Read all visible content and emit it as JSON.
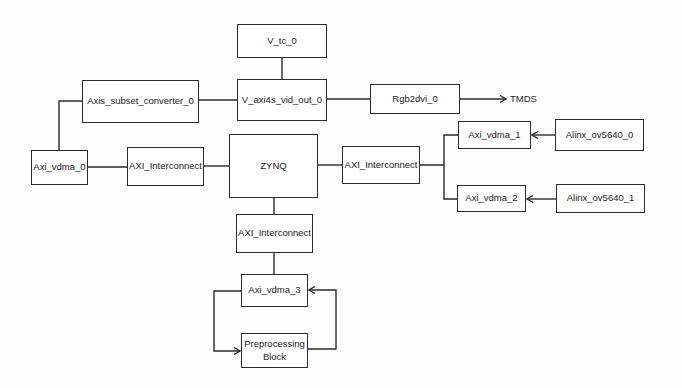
{
  "diagram": {
    "colors": {
      "stroke": "#2b2b2b",
      "text": "#222222",
      "background": "#ffffff"
    },
    "blocks": {
      "v_tc_0": {
        "label": "V_tc_0"
      },
      "v_axi4s_vid_out_0": {
        "label": "V_axi4s_vid_out_0"
      },
      "axis_subset_converter_0": {
        "label": "Axis_subset_converter_0"
      },
      "rgb2dvi_0": {
        "label": "Rgb2dvi_0"
      },
      "axi_vdma_0": {
        "label": "Axi_vdma_0"
      },
      "axi_interconnect_left": {
        "label": "AXI_Interconnect"
      },
      "zynq": {
        "label": "ZYNQ"
      },
      "axi_interconnect_right": {
        "label": "AXI_Interconnect"
      },
      "axi_vdma_1": {
        "label": "Axi_vdma_1"
      },
      "axi_vdma_2": {
        "label": "Axi_vdma_2"
      },
      "alinx_ov5640_0": {
        "label": "Alinx_ov5640_0"
      },
      "alinx_ov5640_1": {
        "label": "Alinx_ov5640_1"
      },
      "axi_interconnect_bottom": {
        "label": "AXI_Interconnect"
      },
      "axi_vdma_3": {
        "label": "Axi_vdma_3"
      },
      "preprocessing_block": {
        "label": "Preprocessing Block"
      }
    },
    "outputs": {
      "tmds": "TMDS"
    },
    "connections": [
      {
        "from": "V_tc_0",
        "to": "V_axi4s_vid_out_0",
        "type": "line"
      },
      {
        "from": "Axis_subset_converter_0",
        "to": "V_axi4s_vid_out_0",
        "type": "line"
      },
      {
        "from": "V_axi4s_vid_out_0",
        "to": "Rgb2dvi_0",
        "type": "line"
      },
      {
        "from": "Rgb2dvi_0",
        "to": "TMDS",
        "type": "arrow"
      },
      {
        "from": "Axi_vdma_0",
        "to": "Axis_subset_converter_0",
        "type": "line"
      },
      {
        "from": "Axi_vdma_0",
        "to": "AXI_Interconnect (left)",
        "type": "line"
      },
      {
        "from": "AXI_Interconnect (left)",
        "to": "ZYNQ",
        "type": "line"
      },
      {
        "from": "ZYNQ",
        "to": "AXI_Interconnect (right)",
        "type": "line"
      },
      {
        "from": "AXI_Interconnect (right)",
        "to": "Axi_vdma_1",
        "type": "line"
      },
      {
        "from": "AXI_Interconnect (right)",
        "to": "Axi_vdma_2",
        "type": "line"
      },
      {
        "from": "Alinx_ov5640_0",
        "to": "Axi_vdma_1",
        "type": "arrow"
      },
      {
        "from": "Alinx_ov5640_1",
        "to": "Axi_vdma_2",
        "type": "arrow"
      },
      {
        "from": "ZYNQ",
        "to": "AXI_Interconnect (bottom)",
        "type": "line"
      },
      {
        "from": "AXI_Interconnect (bottom)",
        "to": "Axi_vdma_3",
        "type": "line"
      },
      {
        "from": "Axi_vdma_3",
        "to": "Preprocessing Block",
        "type": "arrow"
      },
      {
        "from": "Preprocessing Block",
        "to": "Axi_vdma_3",
        "type": "arrow"
      }
    ]
  }
}
